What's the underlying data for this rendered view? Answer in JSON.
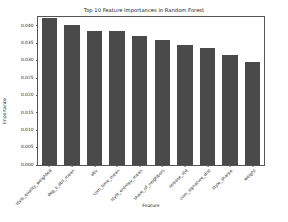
{
  "chart_data": {
    "type": "bar",
    "title": "Top 10 Feature Importances in Random Forest",
    "xlabel": "Feature",
    "ylabel": "Importance",
    "grid": false,
    "legend": null,
    "ylim": [
      0.0,
      0.0425
    ],
    "yticks": [
      "0.000",
      "0.005",
      "0.010",
      "0.015",
      "0.020",
      "0.025",
      "0.030",
      "0.035",
      "0.040"
    ],
    "ytick_values": [
      0.0,
      0.005,
      0.01,
      0.015,
      0.02,
      0.025,
      0.03,
      0.035,
      0.04
    ],
    "categories": [
      "style_quality_weighted",
      "deg_z_abs_mean",
      "abv",
      "com_time_mean",
      "style_entropy_mean",
      "share_of_neighbors",
      "release_std",
      "com_signature_dist",
      "style_sharpe",
      "weight"
    ],
    "values": [
      0.0421,
      0.0402,
      0.0384,
      0.0384,
      0.0371,
      0.036,
      0.0345,
      0.0336,
      0.0316,
      0.0295
    ],
    "bar_color": "#4a4a4a",
    "axes_color": "#555555",
    "text_color": "#1a1a1a",
    "background": "#ffffff",
    "xtick_rotation": -45
  }
}
